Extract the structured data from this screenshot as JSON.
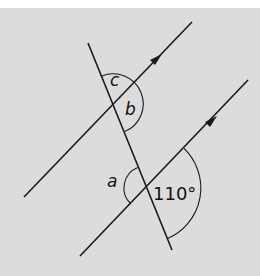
{
  "diagram": {
    "background": "#dcdcdc",
    "line_color": "#1a1a1a",
    "lines": [
      {
        "name": "upper-parallel-line",
        "from": [
          24,
          197
        ],
        "to": [
          192,
          22
        ],
        "arrow_at": [
          158,
          58
        ]
      },
      {
        "name": "lower-parallel-line",
        "from": [
          80,
          256
        ],
        "to": [
          248,
          80
        ],
        "arrow_at": [
          213,
          120
        ]
      },
      {
        "name": "transversal",
        "from": [
          88,
          43
        ],
        "to": [
          172,
          250
        ]
      }
    ],
    "angles": [
      {
        "label": "c",
        "at": "upper intersection, above"
      },
      {
        "label": "b",
        "at": "upper intersection, right"
      },
      {
        "label": "a",
        "at": "lower intersection, left"
      },
      {
        "label": "110°",
        "at": "lower intersection, right"
      }
    ],
    "labels": {
      "c": "c",
      "b": "b",
      "a": "a",
      "given": "110°"
    }
  }
}
